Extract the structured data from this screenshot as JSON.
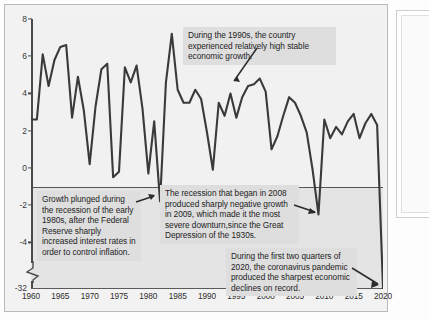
{
  "chart_data": {
    "type": "line",
    "title": "",
    "xlabel": "",
    "ylabel": "",
    "xlim": [
      1960,
      2020
    ],
    "ylim": [
      -32,
      8
    ],
    "grid": false,
    "legend": "none",
    "y_axis_broken": true,
    "y_break_between": [
      -5,
      -30
    ],
    "yticks": [
      "8",
      "6",
      "4",
      "2",
      "0",
      "-2",
      "-4",
      "-32"
    ],
    "ytick_values": [
      8,
      6,
      4,
      2,
      0,
      -2,
      -4,
      -32
    ],
    "xticks": [
      "1960",
      "1965",
      "1970",
      "1975",
      "1980",
      "1985",
      "1990",
      "1995",
      "2000",
      "2005",
      "2010",
      "2015",
      "2020"
    ],
    "xtick_values": [
      1960,
      1965,
      1970,
      1975,
      1980,
      1985,
      1990,
      1995,
      2000,
      2005,
      2010,
      2015,
      2020
    ],
    "line_color": "#3a3a3a",
    "x": [
      1960,
      1961,
      1962,
      1963,
      1964,
      1965,
      1966,
      1967,
      1968,
      1969,
      1970,
      1971,
      1972,
      1973,
      1974,
      1975,
      1976,
      1977,
      1978,
      1979,
      1980,
      1981,
      1982,
      1983,
      1984,
      1985,
      1986,
      1987,
      1988,
      1989,
      1990,
      1991,
      1992,
      1993,
      1994,
      1995,
      1996,
      1997,
      1998,
      1999,
      2000,
      2001,
      2002,
      2003,
      2004,
      2005,
      2006,
      2007,
      2008,
      2009,
      2010,
      2011,
      2012,
      2013,
      2014,
      2015,
      2016,
      2017,
      2018,
      2019,
      2020
    ],
    "values": [
      2.6,
      2.6,
      6.1,
      4.4,
      5.8,
      6.5,
      6.6,
      2.7,
      4.9,
      3.1,
      0.2,
      3.3,
      5.3,
      5.6,
      -0.5,
      -0.2,
      5.4,
      4.6,
      5.5,
      3.2,
      -0.3,
      2.5,
      -1.8,
      4.6,
      7.2,
      4.2,
      3.5,
      3.5,
      4.2,
      3.7,
      1.9,
      -0.1,
      3.5,
      2.8,
      4.0,
      2.7,
      3.8,
      4.4,
      4.5,
      4.8,
      4.1,
      1.0,
      1.7,
      2.8,
      3.8,
      3.5,
      2.8,
      1.9,
      -0.1,
      -2.5,
      2.6,
      1.6,
      2.2,
      1.8,
      2.5,
      2.9,
      1.6,
      2.4,
      2.9,
      2.3,
      -32.0
    ],
    "annotations": [
      {
        "id": "annotation-1990s-growth",
        "text": "During the 1990s, the country experienced relatively high stable economic growth.",
        "points_to_year": 1998
      },
      {
        "id": "annotation-early-1980s-recession",
        "text": "Growth plunged during the recession of the early 1980s, after the Federal Reserve sharply increased interest rates in order to control inflation.",
        "points_to_year": 1982
      },
      {
        "id": "annotation-2008-recession",
        "text": "The recession that began in 2008 produced sharply negative growth in 2009, which made it the most severe downturn,since the Great Depression of the 1930s.",
        "points_to_year": 2009
      },
      {
        "id": "annotation-covid-2020",
        "text": "During the first two quarters of 2020, the coronavirus pandemic produced the sharpest economic declines on record.",
        "points_to_year": 2020
      }
    ]
  },
  "colors": {
    "line": "#3a3a3a",
    "plot_background": "#f1f1f1",
    "negative_region": "#e4e4e4",
    "annotation_background": "#dedede",
    "axis": "#4a4a4a"
  }
}
